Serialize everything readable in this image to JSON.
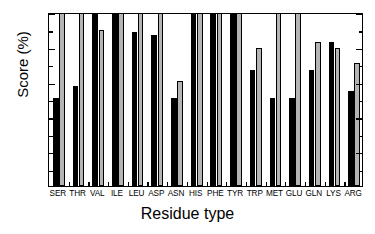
{
  "chart_data": {
    "type": "bar",
    "title": "",
    "xlabel": "Residue type",
    "ylabel": "Score (%)",
    "ylim": [
      0,
      100
    ],
    "yticks": [
      0,
      20,
      40,
      60,
      80,
      100
    ],
    "yminorticks": [
      10,
      30,
      50,
      70,
      90
    ],
    "grid": false,
    "legend": "none",
    "categories": [
      "SER",
      "THR",
      "VAL",
      "ILE",
      "LEU",
      "ASP",
      "ASN",
      "HIS",
      "PHE",
      "TYR",
      "TRP",
      "MET",
      "GLU",
      "GLN",
      "LYS",
      "ARG"
    ],
    "series": [
      {
        "name": "black",
        "color": "#000000",
        "values": [
          50,
          57,
          100,
          100,
          88,
          86,
          50,
          100,
          100,
          100,
          66,
          50,
          50,
          66,
          82,
          54
        ]
      },
      {
        "name": "gray",
        "color": "#b4b4b4",
        "values": [
          100,
          100,
          89,
          100,
          100,
          100,
          60,
          100,
          100,
          100,
          79,
          100,
          100,
          82,
          79,
          70
        ]
      }
    ]
  },
  "axis": {
    "y_title": "Score (%)",
    "x_title": "Residue type",
    "y_tick_labels": [
      "0",
      "20",
      "40",
      "60",
      "80",
      "100"
    ]
  }
}
